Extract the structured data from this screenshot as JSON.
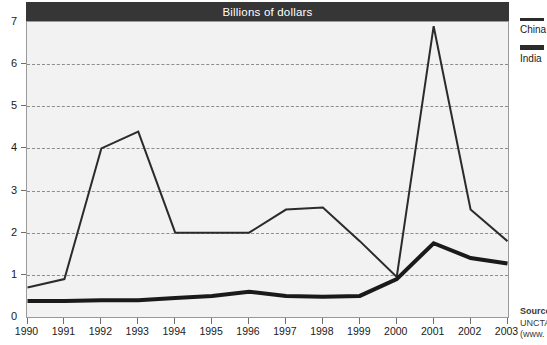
{
  "chart_data": {
    "type": "line",
    "title": "Billions of dollars",
    "xlabel": "",
    "ylabel": "",
    "categories": [
      "1990",
      "1991",
      "1992",
      "1993",
      "1994",
      "1995",
      "1996",
      "1997",
      "1998",
      "1999",
      "2000",
      "2001",
      "2002",
      "2003"
    ],
    "x": [
      1990,
      1991,
      1992,
      1993,
      1994,
      1995,
      1996,
      1997,
      1998,
      1999,
      2000,
      2001,
      2002,
      2003
    ],
    "ylim": [
      0,
      7
    ],
    "xlim": [
      1990,
      2003
    ],
    "yticks": [
      0,
      1,
      2,
      3,
      4,
      5,
      6,
      7
    ],
    "ytick_labels": [
      "0",
      "1",
      "2",
      "3",
      "4",
      "5",
      "6",
      "7"
    ],
    "grid": true,
    "grid_style": "dashed-horizontal",
    "legend_position": "right",
    "series": [
      {
        "name": "China",
        "line_width": 2,
        "color": "#2b2b2b",
        "values": [
          0.7,
          0.9,
          4.0,
          4.4,
          2.0,
          2.0,
          2.0,
          2.55,
          2.6,
          1.8,
          0.95,
          6.9,
          2.55,
          1.8
        ]
      },
      {
        "name": "India",
        "line_width": 4,
        "color": "#1a1a1a",
        "values": [
          0.38,
          0.38,
          0.4,
          0.4,
          0.45,
          0.5,
          0.6,
          0.5,
          0.48,
          0.5,
          0.9,
          1.75,
          1.4,
          1.27
        ]
      }
    ]
  },
  "legend": {
    "entries": [
      {
        "label": "China",
        "swatch_height": 3
      },
      {
        "label": "India",
        "swatch_height": 5
      }
    ]
  },
  "source_note": {
    "line1": "Source:",
    "line2": "UNCTAD",
    "line3": "(www."
  },
  "colors": {
    "title_bar_background": "#363636",
    "title_bar_text": "#ffffff",
    "plot_background": "#f2f2f2",
    "plot_border": "#9a9a9a",
    "gridline": "#8d8d8d",
    "series_china": "#2b2b2b",
    "series_india": "#1a1a1a",
    "axis_text": "#1a1a1a"
  }
}
